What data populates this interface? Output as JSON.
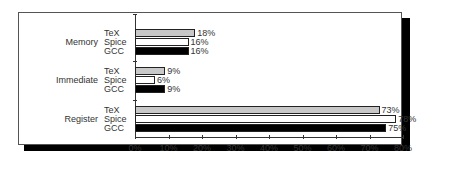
{
  "chart_data": {
    "type": "bar",
    "orientation": "horizontal",
    "title": "",
    "xlabel": "",
    "ylabel": "",
    "xlim": [
      0,
      80
    ],
    "x_ticks": [
      "0%",
      "10%",
      "20%",
      "30%",
      "40%",
      "50%",
      "60%",
      "70%",
      "80%"
    ],
    "categories": [
      "Memory",
      "Immediate",
      "Register"
    ],
    "series": [
      {
        "name": "TeX",
        "color": "#c8c8c8",
        "values": [
          18,
          9,
          73
        ]
      },
      {
        "name": "Spice",
        "color": "#ffffff",
        "values": [
          16,
          6,
          78
        ]
      },
      {
        "name": "GCC",
        "color": "#000000",
        "values": [
          16,
          9,
          75
        ]
      }
    ],
    "value_labels": [
      [
        "18%",
        "16%",
        "16%"
      ],
      [
        "9%",
        "6%",
        "9%"
      ],
      [
        "73%",
        "78%",
        "75%"
      ]
    ],
    "grid": false,
    "legend": "none (series names labeled per group)"
  },
  "labels": {
    "categories": [
      "Memory",
      "Immediate",
      "Register"
    ],
    "series": [
      "TeX",
      "Spice",
      "GCC"
    ],
    "ticks": [
      "0%",
      "10%",
      "20%",
      "30%",
      "40%",
      "50%",
      "60%",
      "70%",
      "80%"
    ]
  }
}
